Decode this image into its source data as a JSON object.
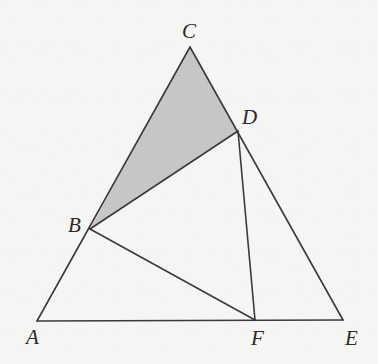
{
  "figure": {
    "background_color": "#f5f5f3",
    "stroke_color": "#3a3a3a",
    "stroke_width": 1.6,
    "shaded_fill_color": "#c9c9c9",
    "shaded_region_name": "triangle-BCD",
    "points": [
      {
        "id": "A",
        "label": "A",
        "x": 37,
        "y": 321,
        "label_x": 26,
        "label_y": 344
      },
      {
        "id": "B",
        "label": "B",
        "x": 90,
        "y": 229,
        "label_x": 68,
        "label_y": 232
      },
      {
        "id": "C",
        "label": "C",
        "x": 190,
        "y": 47,
        "label_x": 182,
        "label_y": 38
      },
      {
        "id": "D",
        "label": "D",
        "x": 238,
        "y": 131,
        "label_x": 242,
        "label_y": 124
      },
      {
        "id": "E",
        "label": "E",
        "x": 343,
        "y": 320,
        "label_x": 345,
        "label_y": 345
      },
      {
        "id": "F",
        "label": "F",
        "x": 255,
        "y": 320,
        "label_x": 251,
        "label_y": 345
      }
    ],
    "segments": [
      {
        "id": "AC",
        "name": "segment-A-C",
        "from": "A",
        "to": "C"
      },
      {
        "id": "CE",
        "name": "segment-C-E",
        "from": "C",
        "to": "E"
      },
      {
        "id": "AE",
        "name": "segment-A-E",
        "from": "A",
        "to": "E"
      },
      {
        "id": "BD",
        "name": "segment-B-D",
        "from": "B",
        "to": "D"
      },
      {
        "id": "BF",
        "name": "segment-B-F",
        "from": "B",
        "to": "F"
      },
      {
        "id": "DF",
        "name": "segment-D-F",
        "from": "D",
        "to": "F"
      }
    ],
    "shaded_polygon": [
      "B",
      "C",
      "D"
    ]
  }
}
